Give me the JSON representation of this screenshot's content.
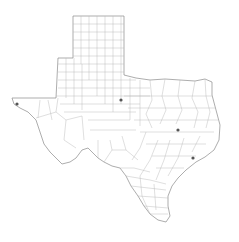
{
  "map": {
    "region": "Texas",
    "subdivisions": "counties",
    "background_color": "#ffffff",
    "border_color": "#8a8a8a",
    "county_line_color": "#b8b8b8",
    "marker_color": "#555555",
    "markers": [
      {
        "id": "marker-1",
        "x": 17,
        "y": 104
      },
      {
        "id": "marker-2",
        "x": 121,
        "y": 100
      },
      {
        "id": "marker-3",
        "x": 178,
        "y": 130
      },
      {
        "id": "marker-4",
        "x": 193,
        "y": 158
      }
    ]
  }
}
